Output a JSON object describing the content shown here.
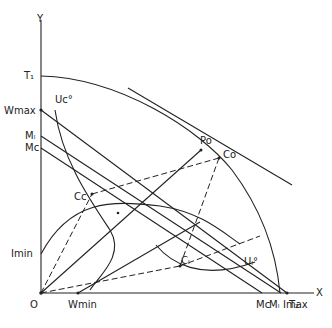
{
  "figure": {
    "axes": {
      "x_label": "X",
      "y_label": "Y",
      "origin_label": "O"
    },
    "y_axis_labels": {
      "t1": "T₁",
      "wmax": "Wmax",
      "ml": "Mₗ",
      "mc": "Mc",
      "imin": "Imin"
    },
    "x_axis_labels": {
      "wmin": "Wmin",
      "mc": "Mc",
      "ml": "Mₗ",
      "imax": "Imax",
      "t2": "T₂"
    },
    "point_labels": {
      "p0": "Po",
      "c0": "Co",
      "cc": "Cc",
      "cl": "Cₗ"
    },
    "curve_labels": {
      "uc": "Uc°",
      "ul": "Uₗ°"
    },
    "stroke_color": "#222222"
  }
}
